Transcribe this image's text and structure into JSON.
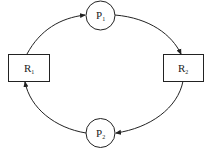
{
  "diagram": {
    "type": "resource-allocation-graph",
    "colors": {
      "stroke": "#222222",
      "background": "#ffffff"
    },
    "nodes": {
      "p1": {
        "kind": "process",
        "shape": "circle",
        "letter": "P",
        "sub": "1"
      },
      "p2": {
        "kind": "process",
        "shape": "circle",
        "letter": "P",
        "sub": "2"
      },
      "r1": {
        "kind": "resource",
        "shape": "rectangle",
        "letter": "R",
        "sub": "1"
      },
      "r2": {
        "kind": "resource",
        "shape": "rectangle",
        "letter": "R",
        "sub": "2"
      }
    },
    "edges": [
      {
        "from": "R1",
        "to": "P1"
      },
      {
        "from": "P1",
        "to": "R2"
      },
      {
        "from": "R2",
        "to": "P2"
      },
      {
        "from": "P2",
        "to": "R1"
      }
    ]
  }
}
